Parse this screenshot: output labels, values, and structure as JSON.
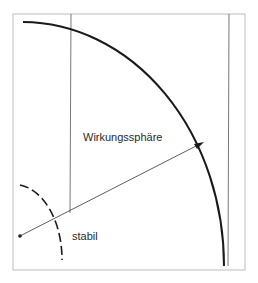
{
  "diagram": {
    "labels": {
      "sphere": "Wirkungssphäre",
      "stable": "stabil"
    },
    "colors": {
      "line": "#1a1a1a",
      "frame": "#bdbdbd",
      "background": "#ffffff"
    }
  }
}
